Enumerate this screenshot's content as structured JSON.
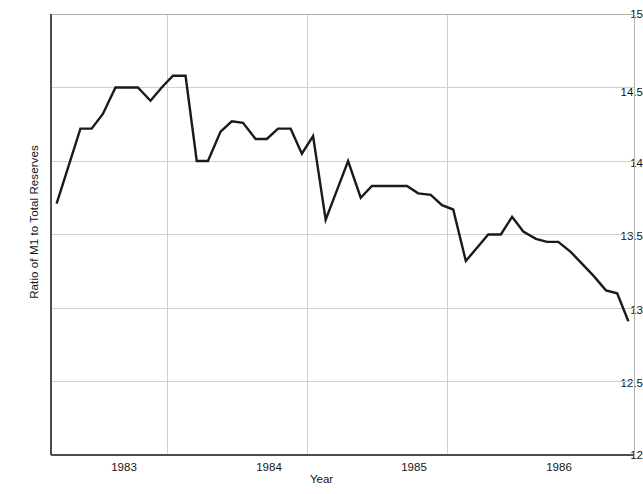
{
  "chart_data": {
    "type": "line",
    "title": "",
    "xlabel": "Year",
    "ylabel": "Ratio of M1 to Total Reserves",
    "xlim": [
      1982.67,
      1986.83
    ],
    "ylim": [
      12,
      15
    ],
    "yticks": [
      12,
      12.5,
      13,
      13.5,
      14,
      14.5,
      15
    ],
    "ytick_labels": [
      "12",
      "12.5",
      "13",
      "13.5",
      "14",
      "14.5",
      "15"
    ],
    "xticks": [
      1983,
      1984,
      1985,
      1986
    ],
    "xtick_labels": [
      "1983",
      "1984",
      "1985",
      "1986"
    ],
    "xgridlines": [
      1983.5,
      1984.5,
      1985.5
    ],
    "grid": true,
    "grid_color": "#cfcfcf",
    "axis_color": "#4d4d4d",
    "line_color": "#1a1a1a",
    "line_width": 2.4,
    "series": [
      {
        "name": "Ratio of M1 to Total Reserves",
        "x": [
          1982.71,
          1982.79,
          1982.88,
          1982.96,
          1983.04,
          1983.13,
          1983.21,
          1983.29,
          1983.38,
          1983.46,
          1983.54,
          1983.63,
          1983.71,
          1983.79,
          1983.88,
          1983.96,
          1984.04,
          1984.13,
          1984.21,
          1984.29,
          1984.38,
          1984.46,
          1984.54,
          1984.63,
          1984.71,
          1984.79,
          1984.88,
          1984.96,
          1985.04,
          1985.13,
          1985.21,
          1985.29,
          1985.38,
          1985.46,
          1985.54,
          1985.63,
          1985.71,
          1985.79,
          1985.88,
          1985.96,
          1986.04,
          1986.13,
          1986.21,
          1986.29,
          1986.38,
          1986.46,
          1986.54,
          1986.63,
          1986.71,
          1986.79
        ],
        "y": [
          13.71,
          13.95,
          14.22,
          14.22,
          14.32,
          14.5,
          14.5,
          14.5,
          14.41,
          14.5,
          14.58,
          14.58,
          14.0,
          14.0,
          14.2,
          14.27,
          14.26,
          14.15,
          14.15,
          14.22,
          14.22,
          14.05,
          14.17,
          13.6,
          13.8,
          14.0,
          13.75,
          13.83,
          13.83,
          13.83,
          13.83,
          13.78,
          13.77,
          13.7,
          13.67,
          13.32,
          13.41,
          13.5,
          13.5,
          13.62,
          13.52,
          13.47,
          13.45,
          13.45,
          13.38,
          13.3,
          13.22,
          13.12,
          13.1,
          12.91
        ]
      }
    ]
  },
  "axes": {
    "y_title": "Ratio of M1 to Total Reserves",
    "x_title": "Year"
  }
}
